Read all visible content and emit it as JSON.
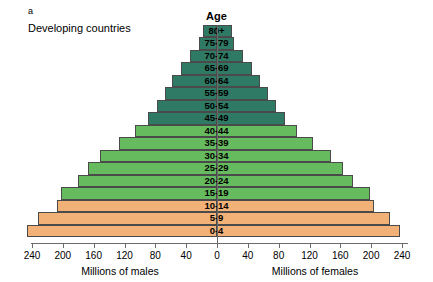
{
  "figure": {
    "panel_letter": "a",
    "panel_title": "Developing countries",
    "age_header": "Age",
    "xlabel_left": "Millions of males",
    "xlabel_right": "Millions of females"
  },
  "colors": {
    "young_band": "#f2b277",
    "mid_band": "#66bb5e",
    "old_band": "#2e7a64",
    "bar_outline": "#4a4a4a",
    "axis": "#6b6b6b",
    "background": "#ffffff"
  },
  "chart_data": {
    "type": "bar",
    "subtype": "population-pyramid",
    "title": "Developing countries",
    "xlabel_left": "Millions of males",
    "xlabel_right": "Millions of females",
    "ylabel": "Age",
    "xlim": [
      -240,
      240
    ],
    "xticks": [
      240,
      200,
      160,
      120,
      80,
      40,
      0,
      40,
      80,
      120,
      160,
      200,
      240
    ],
    "xtick_labels": [
      "240",
      "200",
      "160",
      "120",
      "80",
      "40",
      "0",
      "40",
      "80",
      "120",
      "160",
      "200",
      "240"
    ],
    "grid": false,
    "legend": "none",
    "units": "millions of people",
    "categories": [
      "0-4",
      "5-9",
      "10-14",
      "15-19",
      "20-24",
      "25-29",
      "30-34",
      "35-39",
      "40-44",
      "45-49",
      "50-54",
      "55-59",
      "60-64",
      "65-69",
      "70-74",
      "75-79",
      "80+"
    ],
    "series": [
      {
        "name": "Millions of males",
        "side": "left",
        "values": [
          246,
          232,
          208,
          203,
          180,
          167,
          152,
          127,
          107,
          90,
          78,
          68,
          58,
          47,
          35,
          23,
          18
        ]
      },
      {
        "name": "Millions of females",
        "side": "right",
        "values": [
          238,
          225,
          204,
          198,
          176,
          163,
          148,
          124,
          104,
          88,
          76,
          66,
          56,
          45,
          34,
          22,
          20
        ]
      }
    ],
    "bands": [
      {
        "name": "pre-reproductive",
        "ages": [
          "0-4",
          "5-9",
          "10-14"
        ],
        "color": "#f2b277"
      },
      {
        "name": "reproductive",
        "ages": [
          "15-19",
          "20-24",
          "25-29",
          "30-34",
          "35-39",
          "40-44"
        ],
        "color": "#66bb5e"
      },
      {
        "name": "post-reproductive",
        "ages": [
          "45-49",
          "50-54",
          "55-59",
          "60-64",
          "65-69",
          "70-74",
          "75-79",
          "80+"
        ],
        "color": "#2e7a64"
      }
    ]
  }
}
